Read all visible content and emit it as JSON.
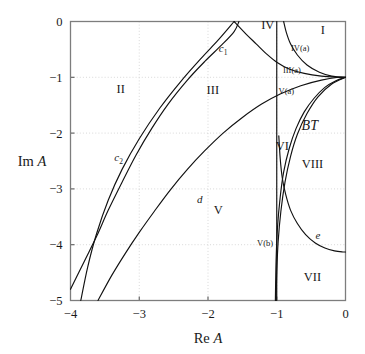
{
  "figure": {
    "background_color": "#ffffff",
    "curve_color": "#111111",
    "frame_color": "#7d7d7d",
    "grid_color": "#c9c9c9"
  },
  "chart_data": {
    "type": "line",
    "title": "",
    "subtitle": "",
    "xlabel_parts": {
      "prefix": "Re",
      "symbol": "A"
    },
    "ylabel_parts": {
      "prefix": "Im",
      "symbol": "A"
    },
    "xlabel": "Re A",
    "ylabel": "Im A",
    "xlim": [
      -4,
      0
    ],
    "ylim": [
      -5,
      0
    ],
    "xticks": [
      -4,
      -3,
      -2,
      -1,
      0
    ],
    "yticks": [
      0,
      -1,
      -2,
      -3,
      -4,
      -5
    ],
    "xtick_labels": [
      "-4",
      "-3",
      "-2",
      "-1",
      "0"
    ],
    "ytick_labels": [
      "0",
      "-1",
      "-2",
      "-3",
      "-4",
      "-5"
    ],
    "grid": true,
    "grid_style": "dotted",
    "legend": "none",
    "legend_position": "none",
    "curves": [
      {
        "name": "c1",
        "label": "c_1",
        "label_text": "c",
        "label_subscript": "1",
        "label_position": [
          -1.78,
          -0.55
        ],
        "points": [
          [
            -1.62,
            0.0
          ],
          [
            -1.45,
            -0.22
          ],
          [
            -1.3,
            -0.4
          ],
          [
            -1.15,
            -0.58
          ],
          [
            -1.0,
            -0.73
          ],
          [
            -0.82,
            -0.85
          ],
          [
            -0.6,
            -0.93
          ],
          [
            -0.35,
            -0.98
          ],
          [
            -0.12,
            -1.0
          ],
          [
            0.0,
            -1.0
          ]
        ]
      },
      {
        "name": "c1-left-branch",
        "label": "",
        "points": [
          [
            -1.62,
            0.0
          ],
          [
            -1.85,
            -0.33
          ],
          [
            -2.1,
            -0.66
          ],
          [
            -2.4,
            -1.08
          ],
          [
            -2.7,
            -1.55
          ],
          [
            -3.0,
            -2.1
          ],
          [
            -3.25,
            -2.65
          ],
          [
            -3.45,
            -3.2
          ],
          [
            -3.62,
            -3.8
          ],
          [
            -3.75,
            -4.4
          ],
          [
            -3.85,
            -5.0
          ]
        ]
      },
      {
        "name": "c2",
        "label": "c_2",
        "label_text": "c",
        "label_subscript": "2",
        "label_position": [
          -3.3,
          -2.5
        ],
        "points": [
          [
            -4.0,
            -4.8
          ],
          [
            -3.8,
            -4.3
          ],
          [
            -3.62,
            -3.85
          ],
          [
            -3.45,
            -3.38
          ],
          [
            -3.25,
            -2.88
          ],
          [
            -3.05,
            -2.4
          ],
          [
            -2.82,
            -1.92
          ],
          [
            -2.58,
            -1.48
          ],
          [
            -2.3,
            -1.05
          ],
          [
            -2.05,
            -0.72
          ],
          [
            -1.8,
            -0.42
          ],
          [
            -1.62,
            -0.18
          ],
          [
            -1.55,
            0.0
          ]
        ]
      },
      {
        "name": "d",
        "label": "d",
        "label_text": "d",
        "label_position": [
          -2.12,
          -3.25
        ],
        "points": [
          [
            -3.6,
            -5.0
          ],
          [
            -3.4,
            -4.55
          ],
          [
            -3.2,
            -4.15
          ],
          [
            -3.0,
            -3.78
          ],
          [
            -2.78,
            -3.4
          ],
          [
            -2.55,
            -3.02
          ],
          [
            -2.3,
            -2.65
          ],
          [
            -2.05,
            -2.32
          ],
          [
            -1.78,
            -2.0
          ],
          [
            -1.5,
            -1.72
          ],
          [
            -1.22,
            -1.48
          ],
          [
            -0.95,
            -1.3
          ],
          [
            -0.65,
            -1.15
          ],
          [
            -0.35,
            -1.05
          ],
          [
            -0.1,
            -1.0
          ],
          [
            0.0,
            -1.0
          ]
        ]
      },
      {
        "name": "e",
        "label": "e",
        "label_text": "e",
        "label_position": [
          -0.4,
          -3.9
        ],
        "points": [
          [
            -0.97,
            -2.05
          ],
          [
            -0.95,
            -2.45
          ],
          [
            -0.92,
            -2.8
          ],
          [
            -0.87,
            -3.1
          ],
          [
            -0.8,
            -3.38
          ],
          [
            -0.7,
            -3.62
          ],
          [
            -0.58,
            -3.82
          ],
          [
            -0.44,
            -3.97
          ],
          [
            -0.3,
            -4.06
          ],
          [
            -0.16,
            -4.11
          ],
          [
            -0.04,
            -4.13
          ],
          [
            0.0,
            -4.13
          ]
        ]
      },
      {
        "name": "iv-a-boundary",
        "label": "",
        "points": [
          [
            -0.9,
            0.0
          ],
          [
            -0.86,
            -0.2
          ],
          [
            -0.8,
            -0.4
          ],
          [
            -0.7,
            -0.6
          ],
          [
            -0.56,
            -0.78
          ],
          [
            -0.38,
            -0.91
          ],
          [
            -0.2,
            -0.98
          ],
          [
            -0.05,
            -1.0
          ],
          [
            0.0,
            -1.0
          ]
        ]
      },
      {
        "name": "v-a-boundary",
        "label": "",
        "points": [
          [
            0.0,
            -1.0
          ],
          [
            -0.14,
            -1.06
          ],
          [
            -0.3,
            -1.18
          ],
          [
            -0.46,
            -1.38
          ],
          [
            -0.6,
            -1.62
          ],
          [
            -0.72,
            -1.92
          ],
          [
            -0.82,
            -2.28
          ],
          [
            -0.9,
            -2.7
          ],
          [
            -0.95,
            -3.15
          ],
          [
            -0.99,
            -3.7
          ],
          [
            -1.01,
            -4.3
          ],
          [
            -1.02,
            -5.0
          ]
        ]
      },
      {
        "name": "vi-boundary",
        "label": "",
        "points": [
          [
            0.0,
            -1.0
          ],
          [
            -0.2,
            -1.12
          ],
          [
            -0.4,
            -1.35
          ],
          [
            -0.56,
            -1.65
          ],
          [
            -0.7,
            -2.02
          ],
          [
            -0.8,
            -2.42
          ],
          [
            -0.88,
            -2.88
          ],
          [
            -0.94,
            -3.4
          ],
          [
            -0.98,
            -3.95
          ],
          [
            -1.0,
            -4.5
          ],
          [
            -1.01,
            -5.0
          ]
        ]
      },
      {
        "name": "vertical-line-re-minus-one",
        "label": "",
        "points": [
          [
            -1.0,
            0.0
          ],
          [
            -1.0,
            -5.0
          ]
        ]
      }
    ],
    "regions": [
      {
        "label": "I",
        "position": [
          -0.33,
          -0.22
        ],
        "size": "normal"
      },
      {
        "label": "II",
        "position": [
          -3.27,
          -1.28
        ],
        "size": "normal"
      },
      {
        "label": "III",
        "position": [
          -1.93,
          -1.3
        ],
        "size": "normal"
      },
      {
        "label": "IV",
        "position": [
          -1.13,
          -0.14
        ],
        "size": "normal"
      },
      {
        "label": "IV(a)",
        "position": [
          -0.66,
          -0.52
        ],
        "size": "small"
      },
      {
        "label": "III(a)",
        "position": [
          -0.78,
          -0.92
        ],
        "size": "small"
      },
      {
        "label": "V(a)",
        "position": [
          -0.86,
          -1.3
        ],
        "size": "small"
      },
      {
        "label": "BT",
        "position": [
          -0.52,
          -1.95
        ],
        "size": "bt"
      },
      {
        "label": "VI",
        "position": [
          -0.92,
          -2.3
        ],
        "size": "normal"
      },
      {
        "label": "VIII",
        "position": [
          -0.48,
          -2.62
        ],
        "size": "normal"
      },
      {
        "label": "V",
        "position": [
          -1.85,
          -3.45
        ],
        "size": "normal"
      },
      {
        "label": "V(b)",
        "position": [
          -1.17,
          -4.02
        ],
        "size": "small"
      },
      {
        "label": "VII",
        "position": [
          -0.48,
          -4.65
        ],
        "size": "normal"
      }
    ]
  }
}
